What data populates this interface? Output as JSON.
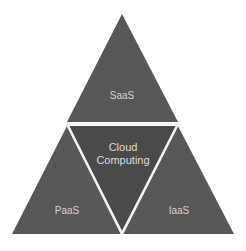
{
  "diagram": {
    "type": "triangle-segmented",
    "segments": {
      "top": {
        "label": "SaaS"
      },
      "center": {
        "label_line1": "Cloud",
        "label_line2": "Computing"
      },
      "bottom_left": {
        "label": "PaaS"
      },
      "bottom_right": {
        "label": "IaaS"
      }
    },
    "colors": {
      "segment_fill": "#575757",
      "center_fill": "#4a4a4a",
      "divider": "#f2f2f2",
      "text": "#d2d2d2",
      "background": "#ffffff"
    }
  }
}
